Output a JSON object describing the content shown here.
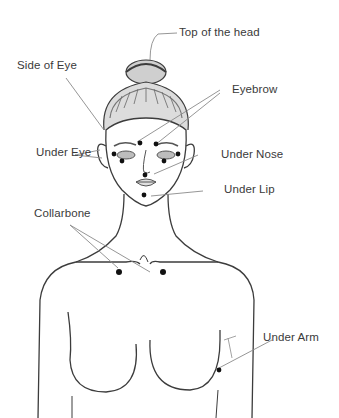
{
  "diagram": {
    "type": "anatomical-tapping-points",
    "labels": {
      "top_of_head": "Top of the head",
      "side_of_eye": "Side of Eye",
      "eyebrow": "Eyebrow",
      "under_eye": "Under Eye",
      "under_nose": "Under Nose",
      "under_lip": "Under Lip",
      "collarbone": "Collarbone",
      "under_arm": "Under Arm"
    },
    "colors": {
      "line": "#3c3c3c",
      "leader": "#8a8a8a",
      "point": "#111111",
      "text": "#3a3a3a"
    }
  }
}
